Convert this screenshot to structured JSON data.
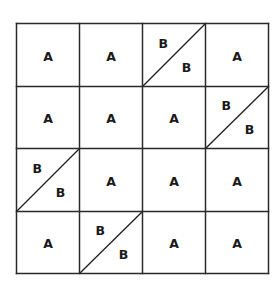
{
  "diagram": {
    "title": "",
    "rows": 4,
    "cols": 4,
    "colors": {
      "line": "#2a2a2a",
      "text": "#1a1a1a",
      "background": "#ffffff"
    },
    "cells": [
      [
        {
          "type": "single",
          "label": "A"
        },
        {
          "type": "single",
          "label": "A"
        },
        {
          "type": "split",
          "upper": "B",
          "lower": "B"
        },
        {
          "type": "single",
          "label": "A"
        }
      ],
      [
        {
          "type": "single",
          "label": "A"
        },
        {
          "type": "single",
          "label": "A"
        },
        {
          "type": "single",
          "label": "A"
        },
        {
          "type": "split",
          "upper": "B",
          "lower": "B"
        }
      ],
      [
        {
          "type": "split",
          "upper": "B",
          "lower": "B"
        },
        {
          "type": "single",
          "label": "A"
        },
        {
          "type": "single",
          "label": "A"
        },
        {
          "type": "single",
          "label": "A"
        }
      ],
      [
        {
          "type": "single",
          "label": "A"
        },
        {
          "type": "split",
          "upper": "B",
          "lower": "B"
        },
        {
          "type": "single",
          "label": "A"
        },
        {
          "type": "single",
          "label": "A"
        }
      ]
    ]
  }
}
